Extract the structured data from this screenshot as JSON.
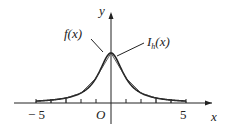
{
  "chart_data": {
    "type": "line",
    "title": "",
    "xlabel": "x",
    "ylabel": "y",
    "origin_label": "O",
    "xlim": [
      -7,
      7
    ],
    "ylim": [
      -0.3,
      1.0
    ],
    "x_ticks": [
      -5,
      -4,
      -3,
      -2,
      -1,
      1,
      2,
      3,
      4,
      5
    ],
    "x_tick_labels": [
      {
        "value": -5,
        "text": "− 5"
      },
      {
        "value": 5,
        "text": "5"
      }
    ],
    "series": [
      {
        "name": "f(x)",
        "function": "1/(1+x^2)",
        "style": "smooth-curve",
        "domain": [
          -5,
          5
        ]
      },
      {
        "name": "I_h(x)",
        "style": "piecewise-linear",
        "nodes_x": [
          -5,
          -4,
          -3,
          -2,
          -1,
          0,
          1,
          2,
          3,
          4,
          5
        ],
        "nodes_y": [
          0.0385,
          0.0588,
          0.1,
          0.2,
          0.5,
          1.0,
          0.5,
          0.2,
          0.1,
          0.0588,
          0.0385
        ]
      }
    ],
    "annotations": [
      {
        "text": "f(x)",
        "points_to": "f(x)",
        "side": "left"
      },
      {
        "text": "I_h(x)",
        "points_to": "I_h(x)",
        "side": "right"
      }
    ]
  }
}
